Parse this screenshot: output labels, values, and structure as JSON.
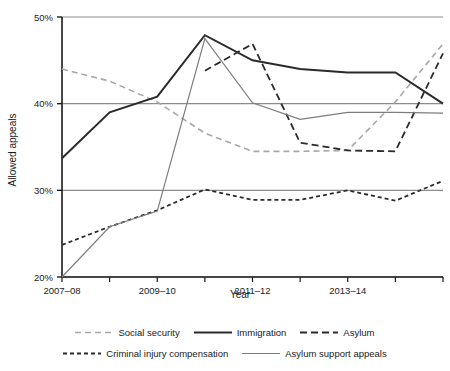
{
  "chart_data": {
    "type": "line",
    "title": "",
    "xlabel": "Year",
    "ylabel": "Allowed appeals",
    "x": [
      "2007-08",
      "2008-09",
      "2009-10",
      "2010-11",
      "2011-12",
      "2012-13",
      "2013-14",
      "2014-15",
      "2015-16"
    ],
    "xtick_labels": [
      "2007–08",
      "2009–10",
      "2011–12",
      "2013–14"
    ],
    "xtick_indices": [
      0,
      2,
      4,
      6
    ],
    "ytick_labels": [
      "20%",
      "30%",
      "40%",
      "50%"
    ],
    "ytick_values": [
      20,
      30,
      40,
      50
    ],
    "ylim": [
      20,
      50
    ],
    "grid": "horizontal",
    "legend_position": "bottom",
    "series": [
      {
        "name": "Social security",
        "style": "dashed",
        "color": "#a8a8a8",
        "width": 1.6,
        "dash": "6,4",
        "values": [
          44.0,
          42.6,
          40.2,
          36.6,
          34.5,
          34.5,
          34.6,
          40.2,
          46.9
        ]
      },
      {
        "name": "Immigration",
        "style": "solid",
        "color": "#2b2b2b",
        "width": 2.0,
        "dash": "",
        "values": [
          33.7,
          39.0,
          40.8,
          47.9,
          45.0,
          44.0,
          43.6,
          43.6,
          40.0
        ]
      },
      {
        "name": "Asylum",
        "style": "dashed",
        "color": "#2b2b2b",
        "width": 1.8,
        "dash": "7,4",
        "values": [
          null,
          null,
          null,
          43.8,
          46.9,
          35.5,
          34.6,
          34.5,
          45.8
        ]
      },
      {
        "name": "Criminal injury compensation",
        "style": "dashed",
        "color": "#2b2b2b",
        "width": 1.8,
        "dash": "4,3",
        "values": [
          23.7,
          25.8,
          27.7,
          30.1,
          28.9,
          28.9,
          30.0,
          28.8,
          31.1
        ]
      },
      {
        "name": "Asylum support appeals",
        "style": "solid",
        "color": "#7d7d7d",
        "width": 1.2,
        "dash": "",
        "values": [
          20.0,
          25.8,
          27.6,
          47.5,
          40.1,
          38.2,
          39.0,
          39.0,
          38.9
        ]
      }
    ]
  },
  "legend": {
    "rows": [
      [
        "Social security",
        "Immigration",
        "Asylum"
      ],
      [
        "Criminal injury compensation",
        "Asylum support appeals"
      ]
    ]
  }
}
